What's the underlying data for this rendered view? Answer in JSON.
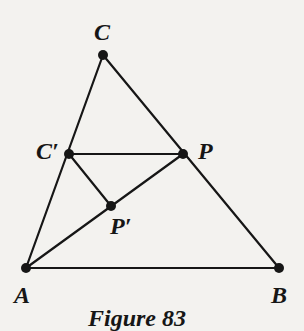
{
  "figure": {
    "caption": "Figure 83",
    "stroke_color": "#161616",
    "background": "#f3f2ef",
    "points": {
      "C": {
        "label": "C",
        "x": 103,
        "y": 55
      },
      "Cp": {
        "label": "C′",
        "x": 69,
        "y": 154
      },
      "P": {
        "label": "P",
        "x": 183,
        "y": 154
      },
      "Pp": {
        "label": "P′",
        "x": 111,
        "y": 206
      },
      "A": {
        "label": "A",
        "x": 26,
        "y": 268
      },
      "B": {
        "label": "B",
        "x": 279,
        "y": 268
      }
    },
    "segments": [
      [
        "C",
        "A"
      ],
      [
        "C",
        "B"
      ],
      [
        "A",
        "B"
      ],
      [
        "C′",
        "P"
      ],
      [
        "C′",
        "P′"
      ],
      [
        "A",
        "P"
      ]
    ]
  }
}
